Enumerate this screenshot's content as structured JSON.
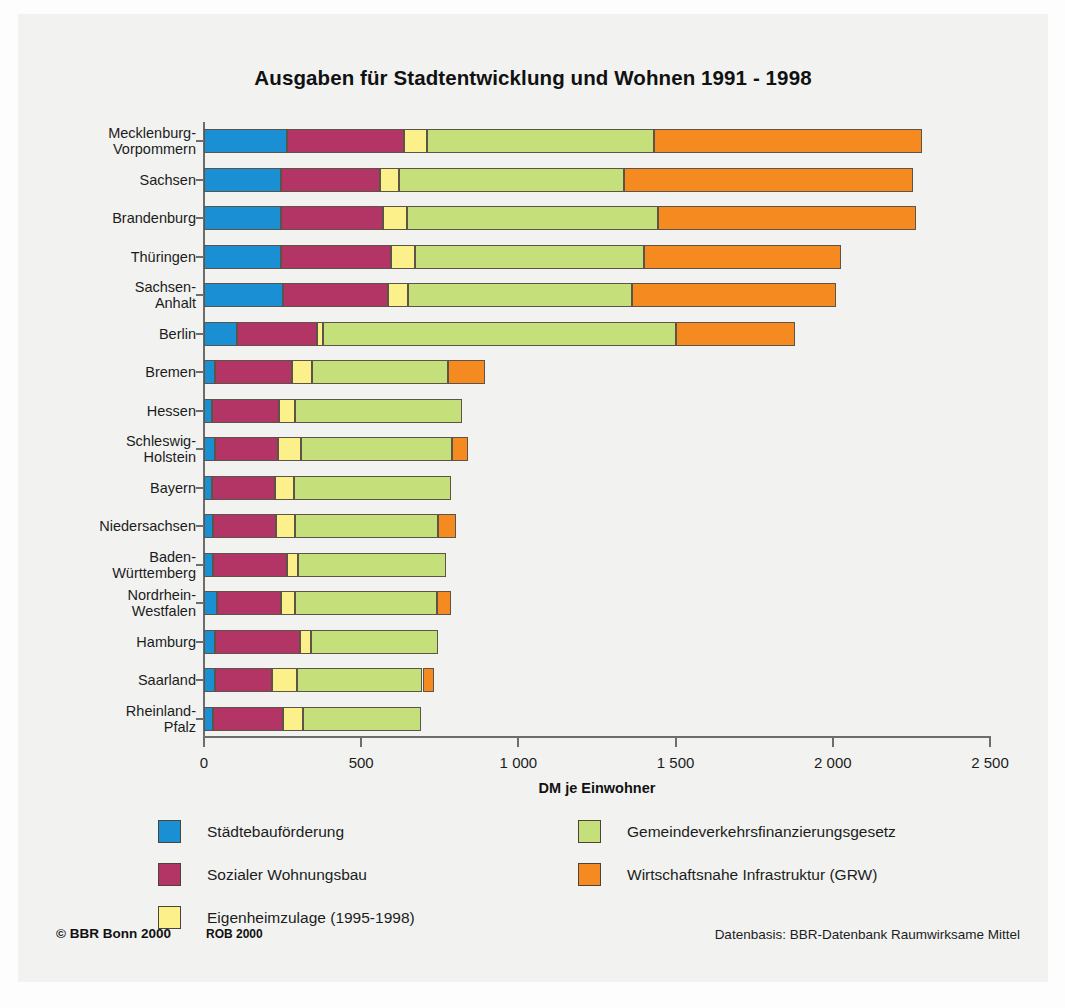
{
  "figure": {
    "title": "Ausgaben für Stadtentwicklung und Wohnen 1991 - 1998",
    "footer_left": "© BBR Bonn 2000",
    "footer_rob": "ROB 2000",
    "footer_right": "Datenbasis: BBR-Datenbank Raumwirksame Mittel"
  },
  "chart_data": {
    "type": "bar",
    "orientation": "horizontal",
    "stacked": true,
    "title": "Ausgaben für Stadtentwicklung und Wohnen 1991 - 1998",
    "xlabel": "DM je Einwohner",
    "ylabel": "",
    "xlim": [
      0,
      2500
    ],
    "xticks": [
      0,
      500,
      1000,
      1500,
      2000,
      2500
    ],
    "xtick_labels": [
      "0",
      "500",
      "1 000",
      "1 500",
      "2 000",
      "2 500"
    ],
    "grid": false,
    "legend_position": "bottom",
    "categories": [
      "Mecklenburg-\nVorpommern",
      "Sachsen",
      "Brandenburg",
      "Thüringen",
      "Sachsen-\nAnhalt",
      "Berlin",
      "Bremen",
      "Hessen",
      "Schleswig-\nHolstein",
      "Bayern",
      "Niedersachsen",
      "Baden-\nWürttemberg",
      "Nordrhein-\nWestfalen",
      "Hamburg",
      "Saarland",
      "Rheinland-\nPfalz"
    ],
    "series": [
      {
        "name": "Städtebauförderung",
        "color": "#1a8fd4",
        "values": [
          265,
          245,
          245,
          245,
          250,
          105,
          35,
          25,
          35,
          25,
          30,
          30,
          40,
          35,
          35,
          30
        ]
      },
      {
        "name": "Sozialer Wohnungsbau",
        "color": "#b23566",
        "values": [
          370,
          315,
          325,
          350,
          335,
          255,
          245,
          215,
          200,
          200,
          200,
          235,
          205,
          270,
          180,
          220
        ]
      },
      {
        "name": "Eigenheimzulage (1995-1998)",
        "color": "#fbf08a",
        "values": [
          75,
          60,
          75,
          75,
          65,
          20,
          65,
          50,
          75,
          60,
          60,
          35,
          45,
          35,
          80,
          65
        ]
      },
      {
        "name": "Gemeindeverkehrsfinanzierungsgesetz",
        "color": "#c5e07a",
        "values": [
          720,
          715,
          800,
          730,
          710,
          1120,
          430,
          530,
          480,
          500,
          455,
          470,
          450,
          405,
          400,
          375
        ]
      },
      {
        "name": "Wirtschaftsnahe Infrastruktur (GRW)",
        "color": "#f58a21",
        "values": [
          855,
          920,
          820,
          625,
          650,
          380,
          120,
          0,
          50,
          0,
          55,
          0,
          45,
          0,
          35,
          0
        ]
      }
    ],
    "totals": [
      2285,
      2255,
      2265,
      2025,
      2010,
      1880,
      895,
      820,
      840,
      785,
      800,
      770,
      785,
      745,
      730,
      690
    ]
  },
  "legend": {
    "left_column": [
      {
        "label": "Städtebauförderung",
        "swatch": "s0"
      },
      {
        "label": "Sozialer Wohnungsbau",
        "swatch": "s1"
      },
      {
        "label": "Eigenheimzulage (1995-1998)",
        "swatch": "s2"
      }
    ],
    "right_column": [
      {
        "label": "Gemeindeverkehrsfinanzierungsgesetz",
        "swatch": "s3"
      },
      {
        "label": "Wirtschaftsnahe Infrastruktur (GRW)",
        "swatch": "s4"
      }
    ]
  }
}
